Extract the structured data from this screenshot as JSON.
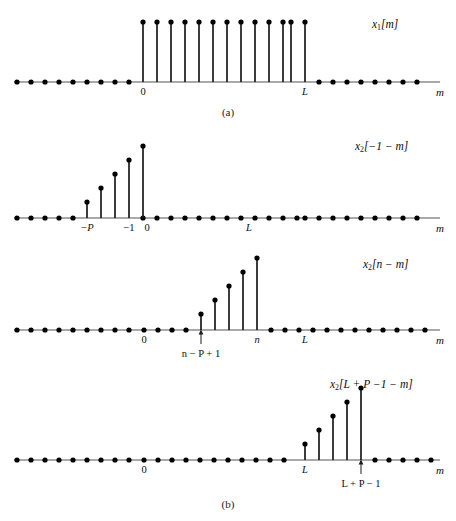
{
  "figure": {
    "captions": [
      {
        "text": "(a)",
        "y": 106
      },
      {
        "text": "(b)",
        "y": 498
      }
    ],
    "axis_variable": "m",
    "panels": [
      {
        "id": "panel-a",
        "signal_label": "x1[m]",
        "signal_label_html": "x<sub>1</sub>[m]",
        "label_x": 372,
        "label_y": 18,
        "top": 0,
        "height": 100,
        "baseline_y": 82,
        "axis_x_start": 14,
        "axis_x_end": 440,
        "axis_arrow_label_x": 436,
        "dot_spacing": 14.1,
        "zero_x": 143,
        "stem_height": 60,
        "stems": [
          {
            "x": 143,
            "h": 60
          },
          {
            "x": 157,
            "h": 60
          },
          {
            "x": 171,
            "h": 60
          },
          {
            "x": 185,
            "h": 60
          },
          {
            "x": 199,
            "h": 60
          },
          {
            "x": 213,
            "h": 60
          },
          {
            "x": 227,
            "h": 60
          },
          {
            "x": 241,
            "h": 60
          },
          {
            "x": 255,
            "h": 60
          },
          {
            "x": 269,
            "h": 60
          },
          {
            "x": 283,
            "h": 60
          },
          {
            "x": 291,
            "h": 60
          },
          {
            "x": 305,
            "h": 60
          }
        ],
        "zero_dots": [
          17,
          31,
          45,
          59,
          73,
          87,
          101,
          115,
          129,
          319,
          333,
          347,
          361,
          375,
          389,
          403,
          417
        ],
        "ticks": [
          {
            "label": "0",
            "x": 143,
            "italic": false
          },
          {
            "label": "L",
            "x": 305,
            "italic": true
          }
        ],
        "arrows": []
      },
      {
        "id": "panel-b1",
        "signal_label": "x2[-1-m]",
        "signal_label_html": "x<sub>2</sub>[&#8722;1 &#8722; m]",
        "label_x": 355,
        "label_y": 140,
        "top": 130,
        "height": 108,
        "baseline_y": 218,
        "axis_x_start": 14,
        "axis_x_end": 440,
        "axis_arrow_label_x": 436,
        "dot_spacing": 14.1,
        "zero_x": 143,
        "stems": [
          {
            "x": 87,
            "h": 16
          },
          {
            "x": 101,
            "h": 30
          },
          {
            "x": 115,
            "h": 44
          },
          {
            "x": 129,
            "h": 58
          },
          {
            "x": 143,
            "h": 72
          }
        ],
        "stems_offset_x": -14,
        "zero_dots": [
          17,
          31,
          45,
          59,
          73,
          143,
          157,
          171,
          185,
          199,
          213,
          227,
          241,
          255,
          269,
          283,
          297,
          305,
          319,
          333,
          347,
          361,
          375,
          389,
          403,
          417
        ],
        "ticks": [
          {
            "label": "−P",
            "x": 87,
            "italic": true
          },
          {
            "label": "−1",
            "x": 129,
            "italic": false
          },
          {
            "label": "0",
            "x": 147,
            "italic": false
          },
          {
            "label": "L",
            "x": 249,
            "italic": true
          }
        ],
        "arrows": []
      },
      {
        "id": "panel-b2",
        "signal_label": "x2[n-m]",
        "signal_label_html": "x<sub>2</sub>[n &#8722; m]",
        "label_x": 363,
        "label_y": 258,
        "top": 250,
        "height": 112,
        "baseline_y": 330,
        "axis_x_start": 14,
        "axis_x_end": 440,
        "axis_arrow_label_x": 436,
        "dot_spacing": 14.1,
        "zero_x": 144,
        "stems": [
          {
            "x": 201,
            "h": 16
          },
          {
            "x": 215,
            "h": 30
          },
          {
            "x": 229,
            "h": 44
          },
          {
            "x": 243,
            "h": 58
          },
          {
            "x": 257,
            "h": 72
          }
        ],
        "zero_dots": [
          17,
          31,
          45,
          59,
          73,
          87,
          101,
          115,
          129,
          144,
          158,
          172,
          186,
          271,
          285,
          299,
          313,
          327,
          341,
          355,
          369,
          383,
          397,
          411,
          425
        ],
        "ticks": [
          {
            "label": "0",
            "x": 144,
            "italic": false
          },
          {
            "label": "n",
            "x": 257,
            "italic": true
          },
          {
            "label": "L",
            "x": 305,
            "italic": true
          }
        ],
        "arrows": [
          {
            "x": 201,
            "label": "n − P + 1",
            "label_x": 201,
            "label_y": 348,
            "tip_y": 330,
            "tail_y": 344
          }
        ]
      },
      {
        "id": "panel-b3",
        "signal_label": "x2[L+P-1-m]",
        "signal_label_html": "x<sub>2</sub>[L + P &#8722;1 &#8722; m]",
        "label_x": 330,
        "label_y": 378,
        "top": 370,
        "height": 120,
        "baseline_y": 460,
        "axis_x_start": 14,
        "axis_x_end": 440,
        "axis_arrow_label_x": 436,
        "dot_spacing": 14.1,
        "zero_x": 144,
        "stems": [
          {
            "x": 305,
            "h": 16
          },
          {
            "x": 319,
            "h": 30
          },
          {
            "x": 333,
            "h": 44
          },
          {
            "x": 347,
            "h": 58
          },
          {
            "x": 361,
            "h": 72
          }
        ],
        "zero_dots": [
          17,
          31,
          45,
          59,
          73,
          87,
          101,
          115,
          129,
          144,
          158,
          172,
          186,
          200,
          214,
          228,
          242,
          256,
          270,
          284,
          375,
          389,
          403,
          417,
          431
        ],
        "ticks": [
          {
            "label": "0",
            "x": 144,
            "italic": false
          },
          {
            "label": "L",
            "x": 305,
            "italic": true
          }
        ],
        "arrows": [
          {
            "x": 361,
            "label": "L + P − 1",
            "label_x": 361,
            "label_y": 478,
            "tip_y": 460,
            "tail_y": 474
          }
        ]
      }
    ],
    "style": {
      "axis_color": "#8c8c8c",
      "stem_color": "#1a1a1a",
      "dot_color": "#000000",
      "dot_radius": 2.6,
      "stem_width": 1.7,
      "axis_width": 1.3
    }
  }
}
